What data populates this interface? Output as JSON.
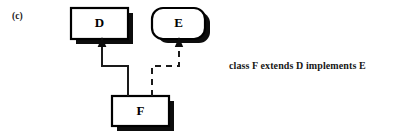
{
  "figure": {
    "part_label": "(c)",
    "caption": "class F extends D  implements E",
    "background_color": "#ffffff",
    "ink_color": "#000000"
  },
  "diagram": {
    "type": "class-diagram",
    "nodes": [
      {
        "id": "D",
        "label": "D",
        "shape": "rectangle",
        "kind": "class",
        "x": 71,
        "y": 8,
        "width": 57,
        "height": 31
      },
      {
        "id": "E",
        "label": "E",
        "shape": "rounded-rectangle",
        "kind": "interface",
        "x": 152,
        "y": 8,
        "width": 53,
        "height": 31
      },
      {
        "id": "F",
        "label": "F",
        "shape": "rectangle",
        "kind": "class",
        "x": 112,
        "y": 96,
        "width": 57,
        "height": 30
      }
    ],
    "edges": [
      {
        "id": "F-extends-D",
        "from": "F",
        "to": "D",
        "style": "solid",
        "relation": "extends",
        "arrow": "filled-triangle"
      },
      {
        "id": "F-implements-E",
        "from": "F",
        "to": "E",
        "style": "dashed",
        "relation": "implements",
        "arrow": "filled-triangle"
      }
    ]
  }
}
